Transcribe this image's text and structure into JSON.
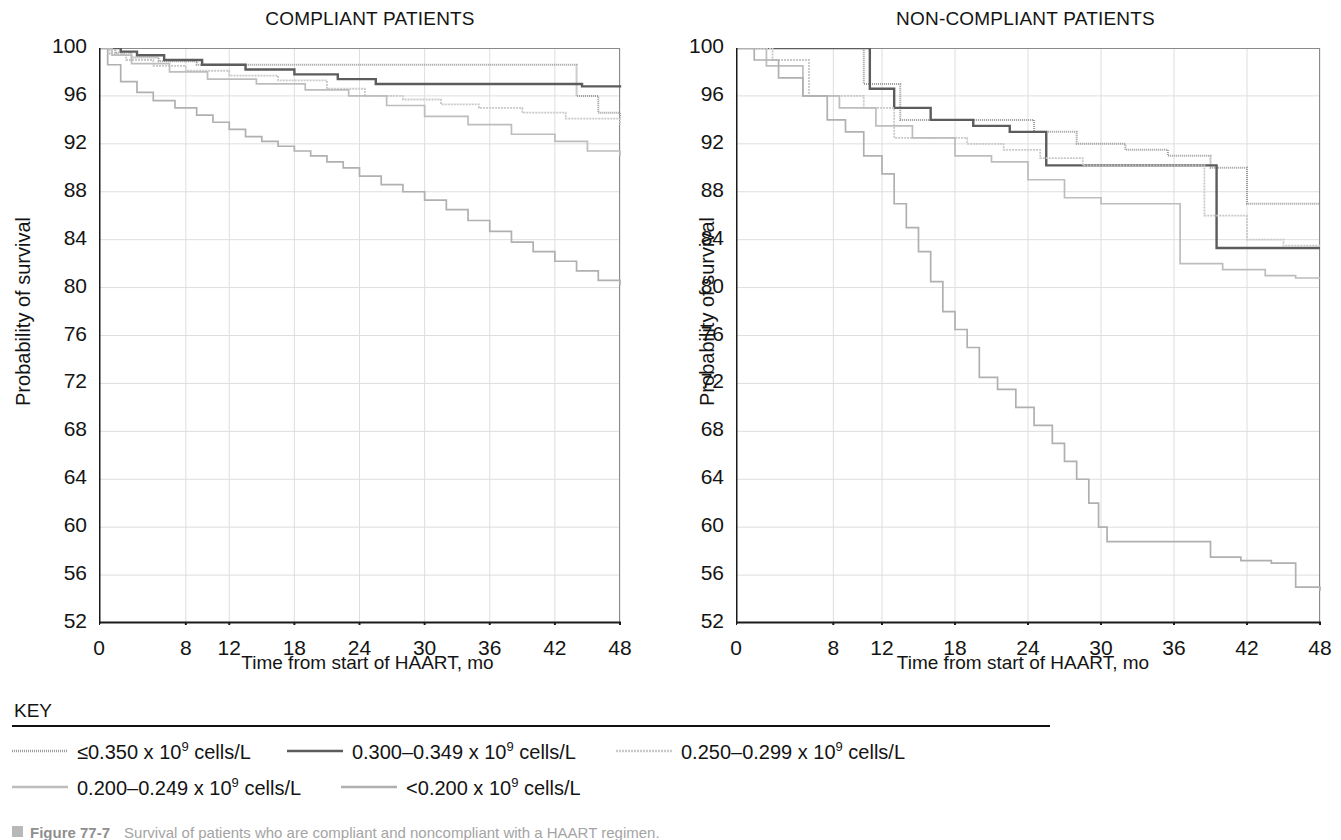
{
  "figure": {
    "caption_marker": "square-bullet",
    "caption_figure_number": "Figure 77-7",
    "caption_text": "Survival of patients who are compliant and noncompliant with a HAART regimen."
  },
  "key": {
    "title": "KEY",
    "entries": [
      {
        "label_prefix": "≤0.350 x 10",
        "exponent": "9",
        "label_suffix": " cells/L",
        "color": "#9b9b9b",
        "width": 2.0,
        "dash": "1,1"
      },
      {
        "label_prefix": "0.300–0.349 x 10",
        "exponent": "9",
        "label_suffix": " cells/L",
        "color": "#5c5c5c",
        "width": 2.4,
        "dash": "none"
      },
      {
        "label_prefix": "0.250–0.299 x 10",
        "exponent": "9",
        "label_suffix": " cells/L",
        "color": "#c9c9c9",
        "width": 1.8,
        "dash": "2,1"
      },
      {
        "label_prefix": "0.200–0.249 x 10",
        "exponent": "9",
        "label_suffix": " cells/L",
        "color": "#bdbdbd",
        "width": 1.7,
        "dash": "none"
      },
      {
        "label_prefix": "<0.200 x 10",
        "exponent": "9",
        "label_suffix": " cells/L",
        "color": "#b0b0b0",
        "width": 1.7,
        "dash": "none"
      }
    ]
  },
  "chart_data": [
    {
      "type": "line",
      "title": "COMPLIANT PATIENTS",
      "xlabel": "Time from start of HAART, mo",
      "ylabel": "Probability of survival",
      "xlim": [
        0,
        48
      ],
      "ylim": [
        52,
        100
      ],
      "xticks": [
        0,
        8,
        12,
        18,
        24,
        30,
        36,
        42,
        48
      ],
      "xtick_labels": [
        "0",
        "8",
        "12",
        "18",
        "24",
        "30",
        "36",
        "42",
        "48"
      ],
      "yticks": [
        52,
        56,
        60,
        64,
        68,
        72,
        76,
        80,
        84,
        88,
        92,
        96,
        100
      ],
      "ytick_labels": [
        "52",
        "56",
        "60",
        "64",
        "68",
        "72",
        "76",
        "80",
        "84",
        "88",
        "92",
        "96",
        "100"
      ],
      "grid": true,
      "legend": "below",
      "series": [
        {
          "name": "≤0.350 x 10^9 cells/L",
          "color": "#9b9b9b",
          "width": 2.0,
          "dash": "1,1",
          "step": "post",
          "x": [
            0,
            1.5,
            3.0,
            5.5,
            9.0,
            14.0,
            21.5,
            26.0,
            33.5,
            40.5,
            44.0,
            46.0,
            48
          ],
          "y": [
            100,
            99.6,
            99.2,
            98.9,
            98.6,
            98.6,
            98.6,
            98.6,
            98.6,
            98.6,
            96.0,
            94.6,
            94.2
          ]
        },
        {
          "name": "0.300–0.349 x 10^9 cells/L",
          "color": "#5c5c5c",
          "width": 2.4,
          "dash": "none",
          "step": "post",
          "x": [
            0,
            2.0,
            3.5,
            6.0,
            9.5,
            13.5,
            18.0,
            22.0,
            25.5,
            29.0,
            33.0,
            36.5,
            41.0,
            44.5,
            48
          ],
          "y": [
            100,
            99.7,
            99.4,
            99.0,
            98.6,
            98.2,
            97.8,
            97.4,
            97.0,
            97.0,
            97.0,
            97.0,
            97.0,
            96.8,
            96.7
          ]
        },
        {
          "name": "0.250–0.299 x 10^9 cells/L",
          "color": "#c9c9c9",
          "width": 1.8,
          "dash": "2,1",
          "step": "post",
          "x": [
            0,
            1.0,
            2.5,
            5.0,
            8.0,
            12.0,
            16.5,
            21.0,
            24.5,
            28.0,
            31.5,
            35.0,
            39.0,
            43.0,
            48
          ],
          "y": [
            100,
            99.5,
            99.0,
            98.5,
            98.1,
            97.7,
            97.3,
            96.6,
            96.0,
            95.7,
            95.3,
            95.0,
            94.6,
            94.1,
            93.6
          ]
        },
        {
          "name": "0.200–0.249 x 10^9 cells/L",
          "color": "#bdbdbd",
          "width": 1.7,
          "dash": "none",
          "step": "post",
          "x": [
            0,
            1.2,
            3.0,
            6.5,
            10.0,
            14.5,
            19.0,
            23.0,
            26.5,
            30.0,
            34.0,
            38.0,
            42.0,
            45.0,
            48
          ],
          "y": [
            100,
            99.4,
            98.7,
            98.0,
            97.4,
            97.0,
            96.5,
            96.0,
            95.2,
            94.3,
            93.6,
            92.8,
            92.2,
            91.4,
            91.0
          ]
        },
        {
          "name": "<0.200 x 10^9 cells/L",
          "color": "#b0b0b0",
          "width": 1.7,
          "dash": "none",
          "step": "post",
          "x": [
            0,
            0.8,
            2.0,
            3.5,
            5.0,
            7.0,
            9.0,
            10.5,
            12.0,
            13.5,
            15.0,
            16.5,
            18.0,
            19.5,
            21.0,
            22.5,
            24.0,
            26.0,
            28.0,
            30.0,
            32.0,
            34.0,
            36.0,
            38.0,
            40.0,
            42.0,
            44.0,
            46.0,
            48
          ],
          "y": [
            100,
            98.6,
            97.2,
            96.3,
            95.6,
            95.0,
            94.4,
            93.8,
            93.2,
            92.6,
            92.2,
            91.8,
            91.4,
            91.0,
            90.5,
            90.0,
            89.3,
            88.6,
            88.0,
            87.3,
            86.5,
            85.6,
            84.7,
            83.8,
            83.0,
            82.2,
            81.4,
            80.6,
            80.2
          ]
        }
      ]
    },
    {
      "type": "line",
      "title": "NON-COMPLIANT PATIENTS",
      "xlabel": "Time from start of HAART, mo",
      "ylabel": "Probability of survival",
      "xlim": [
        0,
        48
      ],
      "ylim": [
        52,
        100
      ],
      "xticks": [
        0,
        8,
        12,
        18,
        24,
        30,
        36,
        42,
        48
      ],
      "xtick_labels": [
        "0",
        "8",
        "12",
        "18",
        "24",
        "30",
        "36",
        "42",
        "48"
      ],
      "yticks": [
        52,
        56,
        60,
        64,
        68,
        72,
        76,
        80,
        84,
        88,
        92,
        96,
        100
      ],
      "ytick_labels": [
        "52",
        "56",
        "60",
        "64",
        "68",
        "72",
        "76",
        "80",
        "84",
        "88",
        "92",
        "96",
        "100"
      ],
      "grid": true,
      "legend": "below",
      "series": [
        {
          "name": "≤0.350 x 10^9 cells/L",
          "color": "#9b9b9b",
          "width": 2.0,
          "dash": "1,1",
          "step": "post",
          "x": [
            0,
            4.0,
            8.5,
            10.5,
            13.5,
            17.0,
            21.0,
            24.5,
            28.0,
            32.0,
            35.5,
            39.0,
            42.0,
            45.0,
            48
          ],
          "y": [
            100,
            100,
            100,
            97.0,
            94.0,
            94.0,
            94.0,
            93.0,
            92.0,
            91.5,
            91.0,
            90.0,
            87.0,
            87.0,
            87.0
          ]
        },
        {
          "name": "0.300–0.349 x 10^9 cells/L",
          "color": "#5c5c5c",
          "width": 2.4,
          "dash": "none",
          "step": "post",
          "x": [
            0,
            5.0,
            9.0,
            11.0,
            13.0,
            16.0,
            19.5,
            22.5,
            25.5,
            29.0,
            33.0,
            36.5,
            39.5,
            43.5,
            48
          ],
          "y": [
            100,
            100,
            100,
            96.6,
            95.0,
            94.0,
            93.5,
            93.0,
            90.2,
            90.2,
            90.2,
            90.2,
            83.3,
            83.3,
            83.3
          ]
        },
        {
          "name": "0.250–0.299 x 10^9 cells/L",
          "color": "#c9c9c9",
          "width": 1.8,
          "dash": "2,1",
          "step": "post",
          "x": [
            0,
            3.0,
            6.0,
            8.0,
            10.5,
            13.0,
            16.0,
            19.0,
            22.0,
            25.0,
            28.5,
            32.0,
            35.5,
            38.5,
            42.0,
            45.0,
            48
          ],
          "y": [
            100,
            99.0,
            96.0,
            96.0,
            95.0,
            92.5,
            92.5,
            92.0,
            91.5,
            90.8,
            90.2,
            90.2,
            90.2,
            86.0,
            84.0,
            83.5,
            83.5
          ]
        },
        {
          "name": "0.200–0.249 x 10^9 cells/L",
          "color": "#bdbdbd",
          "width": 1.7,
          "dash": "none",
          "step": "post",
          "x": [
            0,
            2.5,
            5.5,
            8.5,
            11.5,
            14.5,
            18.0,
            21.0,
            24.0,
            27.0,
            30.0,
            33.5,
            36.5,
            40.0,
            43.5,
            46.0,
            48
          ],
          "y": [
            100,
            98.5,
            96.0,
            95.0,
            93.5,
            92.5,
            91.0,
            90.5,
            89.0,
            87.5,
            87.0,
            87.0,
            82.0,
            81.5,
            81.0,
            80.8,
            80.8
          ]
        },
        {
          "name": "<0.200 x 10^9 cells/L",
          "color": "#b0b0b0",
          "width": 1.7,
          "dash": "none",
          "step": "post",
          "x": [
            0,
            1.5,
            3.5,
            5.5,
            7.5,
            9.0,
            10.5,
            12.0,
            13.0,
            14.0,
            15.0,
            16.0,
            17.0,
            18.0,
            19.0,
            20.0,
            21.5,
            23.0,
            24.5,
            26.0,
            27.0,
            28.0,
            29.0,
            29.8,
            30.5,
            33.0,
            36.0,
            39.0,
            41.5,
            44.0,
            46.0,
            48
          ],
          "y": [
            100,
            99.0,
            97.5,
            96.0,
            94.0,
            93.0,
            91.0,
            89.5,
            87.0,
            85.0,
            83.0,
            80.5,
            78.0,
            76.5,
            75.0,
            72.5,
            71.5,
            70.0,
            68.5,
            67.0,
            65.5,
            64.0,
            62.0,
            60.0,
            58.8,
            58.8,
            58.8,
            57.5,
            57.2,
            57.0,
            55.0,
            54.7
          ]
        }
      ]
    }
  ]
}
